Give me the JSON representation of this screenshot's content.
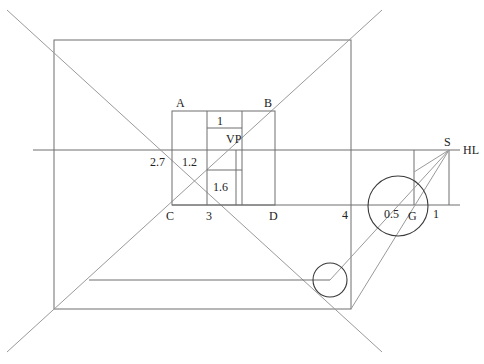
{
  "diagram": {
    "type": "perspective-construction",
    "labels": {
      "A": "A",
      "B": "B",
      "C": "C",
      "D": "D",
      "VP": "VP",
      "S": "S",
      "HL": "HL",
      "G": "G",
      "v_2_7": "2.7",
      "v_1_2": "1.2",
      "v_1": "1",
      "v_1_6": "1.6",
      "v_3": "3",
      "v_4": "4",
      "v_0_5": "0.5",
      "v_1_right": "1"
    },
    "colors": {
      "line": "#6e6e6e",
      "circle": "#3a3a3a",
      "text": "#222222",
      "background": "#ffffff"
    }
  }
}
